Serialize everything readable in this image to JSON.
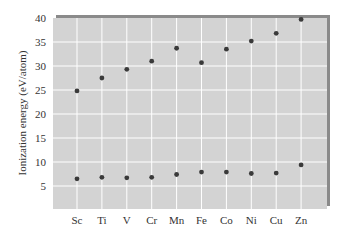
{
  "chart_data": {
    "type": "scatter",
    "title": "",
    "xlabel": "",
    "ylabel": "Ionization energy (eV/atom)",
    "categories": [
      "Sc",
      "Ti",
      "V",
      "Cr",
      "Mn",
      "Fe",
      "Co",
      "Ni",
      "Cu",
      "Zn"
    ],
    "series": [
      {
        "name": "Lower series",
        "values": [
          6.5,
          6.8,
          6.7,
          6.8,
          7.4,
          7.9,
          7.9,
          7.6,
          7.7,
          9.4
        ]
      },
      {
        "name": "Upper series",
        "values": [
          24.8,
          27.5,
          29.3,
          31.0,
          33.7,
          30.7,
          33.5,
          35.2,
          36.8,
          39.7
        ]
      }
    ],
    "yticks": [
      5,
      10,
      15,
      20,
      25,
      30,
      35,
      40
    ],
    "ylim": [
      0.3,
      40
    ],
    "grid": true,
    "legend": "none",
    "colors": {
      "plot_bg": "#d3d3d3",
      "grid": "#ffffff",
      "marker": "#3a3a3a",
      "frame_shadow": "#8a8a8a"
    }
  }
}
